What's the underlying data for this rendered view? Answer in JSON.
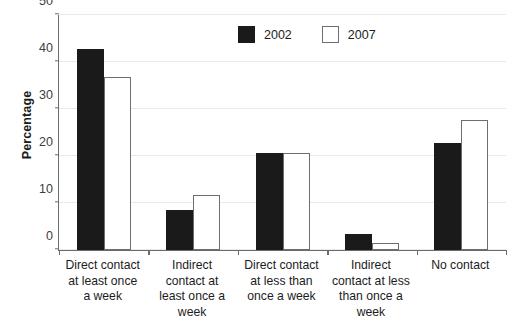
{
  "chart_data": {
    "type": "bar",
    "title": "",
    "xlabel": "",
    "ylabel": "Percentage",
    "ylim": [
      0,
      50
    ],
    "yticks": [
      0,
      10,
      20,
      30,
      40,
      50
    ],
    "grid": true,
    "legend_position": "top-center",
    "categories": [
      "Direct contact at least once a week",
      "Indirect contact at least once a week",
      "Direct contact at less than once a week",
      "Indirect contact at less than once a week",
      "No contact"
    ],
    "category_lines": [
      [
        "Direct contact",
        "at least once",
        "a week"
      ],
      [
        "Indirect",
        "contact at",
        "least once a",
        "week"
      ],
      [
        "Direct contact",
        "at less than",
        "once a week"
      ],
      [
        "Indirect",
        "contact at less",
        "than once a",
        "week"
      ],
      [
        "No contact"
      ]
    ],
    "series": [
      {
        "name": "2002",
        "color": "#1a1a1a",
        "style": "filled",
        "values": [
          42.8,
          8.5,
          20.6,
          3.4,
          22.7
        ]
      },
      {
        "name": "2007",
        "color": "#ffffff",
        "style": "hollow",
        "values": [
          36.8,
          11.8,
          20.6,
          1.5,
          27.7
        ]
      }
    ]
  },
  "axis": {
    "y_title": "Percentage",
    "y_tick_labels": [
      "0",
      "10",
      "20",
      "30",
      "40",
      "50"
    ]
  },
  "legend": {
    "items": [
      {
        "label": "2002",
        "swatch": "filled-square-icon"
      },
      {
        "label": "2007",
        "swatch": "hollow-square-icon"
      }
    ]
  },
  "colors": {
    "series_2002": "#1a1a1a",
    "series_2007_fill": "#ffffff",
    "series_2007_stroke": "#6e6e6e",
    "gridline": "#e9e9e9",
    "axis": "#6b6b6b",
    "text": "#1c1c1c",
    "background": "#ffffff"
  }
}
